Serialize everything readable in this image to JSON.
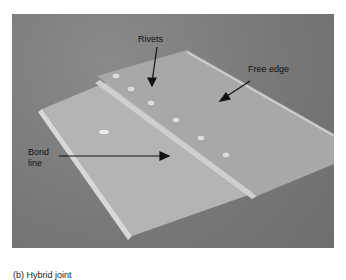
{
  "figure": {
    "labels": {
      "rivets": "Rivets",
      "free_edge": "Free edge",
      "bond_line_1": "Bond",
      "bond_line_2": "line"
    },
    "caption": "(b) Hybrid joint"
  }
}
